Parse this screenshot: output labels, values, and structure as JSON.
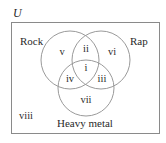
{
  "diagram": {
    "type": "venn",
    "universe": {
      "label": "U"
    },
    "sets": [
      {
        "name": "rock",
        "label": "Rock"
      },
      {
        "name": "rap",
        "label": "Rap"
      },
      {
        "name": "heavy-metal",
        "label": "Heavy metal"
      }
    ],
    "regions": [
      {
        "id": "i",
        "label": "i",
        "description": "Rock ∩ Rap ∩ Heavy metal"
      },
      {
        "id": "ii",
        "label": "ii",
        "description": "Rock ∩ Rap only"
      },
      {
        "id": "iii",
        "label": "iii",
        "description": "Rap ∩ Heavy metal only"
      },
      {
        "id": "iv",
        "label": "iv",
        "description": "Rock ∩ Heavy metal only"
      },
      {
        "id": "v",
        "label": "v",
        "description": "Rock only"
      },
      {
        "id": "vi",
        "label": "vi",
        "description": "Rap only"
      },
      {
        "id": "vii",
        "label": "vii",
        "description": "Heavy metal only"
      },
      {
        "id": "viii",
        "label": "viii",
        "description": "None of the three"
      }
    ]
  }
}
